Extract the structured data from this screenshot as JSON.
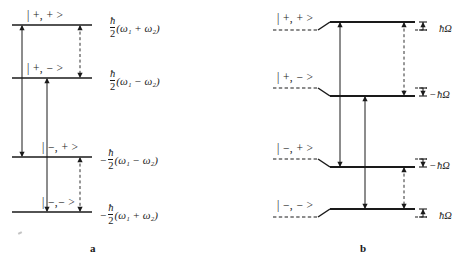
{
  "figure": {
    "width": 465,
    "height": 262,
    "background": "#ffffff",
    "ink": "#1a1a1a"
  },
  "panels": [
    {
      "id": "a",
      "caption": "a",
      "caption_x": 90,
      "caption_y": 243,
      "level_x1": 12,
      "level_x2": 92,
      "levels": [
        {
          "name": "plus-plus",
          "ket": "| +, + >",
          "ket_x": 27,
          "ket_y": 10,
          "y": 25,
          "energy_sign": "",
          "energy_num": "ħ",
          "energy_den": "2",
          "energy_paren": "(ω₁ + ω₂)",
          "energy_x": 108,
          "energy_y": 16
        },
        {
          "name": "plus-minus",
          "ket": "| +, − >",
          "ket_x": 27,
          "ket_y": 63,
          "y": 78,
          "energy_sign": "",
          "energy_num": "ħ",
          "energy_den": "2",
          "energy_paren": "(ω₁ − ω₂)",
          "energy_x": 108,
          "energy_y": 69
        },
        {
          "name": "minus-plus",
          "ket": "| −, + >",
          "ket_x": 42,
          "ket_y": 142,
          "y": 157,
          "energy_sign": "−",
          "energy_num": "ħ",
          "energy_den": "2",
          "energy_paren": "(ω₁ − ω₂)",
          "energy_x": 100,
          "energy_y": 148
        },
        {
          "name": "minus-minus",
          "ket": "| −,− >",
          "ket_x": 42,
          "ket_y": 197,
          "y": 212,
          "energy_sign": "−",
          "energy_num": "ħ",
          "energy_den": "2",
          "energy_paren": "(ω₁ + ω₂)",
          "energy_x": 100,
          "energy_y": 203
        }
      ],
      "arrows": [
        {
          "name": "solid-arrow-left",
          "x": 22,
          "y1": 25,
          "y2": 157,
          "style": "solid",
          "heads": "both"
        },
        {
          "name": "solid-arrow-middle",
          "x": 47,
          "y1": 78,
          "y2": 212,
          "style": "solid",
          "heads": "both"
        },
        {
          "name": "dashed-arrow-upper",
          "x": 80,
          "y1": 25,
          "y2": 78,
          "style": "dashed",
          "heads": "both"
        },
        {
          "name": "dashed-arrow-lower",
          "x": 80,
          "y1": 157,
          "y2": 212,
          "style": "dashed",
          "heads": "both"
        }
      ]
    },
    {
      "id": "b",
      "caption": "b",
      "caption_x": 360,
      "caption_y": 243,
      "dash_x1": 273,
      "dash_x2": 318,
      "ramp_x2": 330,
      "solid_x2": 415,
      "levels": [
        {
          "name": "plus-plus",
          "ket": "| +, + >",
          "ket_x": 277,
          "ket_y": 13,
          "dash_y": 30,
          "solid_y": 22,
          "shift": "up",
          "marker_label": "ħΩ",
          "marker_sign": "",
          "marker_x": 438,
          "marker_y": 24,
          "tick_x": 423,
          "tick_top": 22,
          "tick_bottom": 30
        },
        {
          "name": "plus-minus",
          "ket": "| +, − >",
          "ket_x": 277,
          "ket_y": 72,
          "dash_y": 88,
          "solid_y": 96,
          "shift": "down",
          "marker_label": "ħΩ",
          "marker_sign": "−",
          "marker_x": 430,
          "marker_y": 90,
          "tick_x": 423,
          "tick_top": 88,
          "tick_bottom": 96
        },
        {
          "name": "minus-plus",
          "ket": "| −, + >",
          "ket_x": 277,
          "ket_y": 143,
          "dash_y": 159,
          "solid_y": 167,
          "shift": "down",
          "marker_label": "ħΩ",
          "marker_sign": "−",
          "marker_x": 430,
          "marker_y": 161,
          "tick_x": 423,
          "tick_top": 159,
          "tick_bottom": 167
        },
        {
          "name": "minus-minus",
          "ket": "| −, − >",
          "ket_x": 277,
          "ket_y": 200,
          "dash_y": 217,
          "solid_y": 209,
          "shift": "up",
          "marker_label": "ħΩ",
          "marker_sign": "",
          "marker_x": 438,
          "marker_y": 211,
          "tick_x": 423,
          "tick_top": 209,
          "tick_bottom": 217
        }
      ],
      "arrows": [
        {
          "name": "solid-arrow-left",
          "x": 340,
          "y1": 22,
          "y2": 167,
          "style": "solid",
          "heads": "both"
        },
        {
          "name": "solid-arrow-middle",
          "x": 365,
          "y1": 96,
          "y2": 209,
          "style": "solid",
          "heads": "both"
        },
        {
          "name": "dashed-arrow-upper",
          "x": 404,
          "y1": 22,
          "y2": 96,
          "style": "dashed",
          "heads": "both"
        },
        {
          "name": "dashed-arrow-lower",
          "x": 404,
          "y1": 167,
          "y2": 209,
          "style": "dashed",
          "heads": "both"
        }
      ]
    }
  ]
}
